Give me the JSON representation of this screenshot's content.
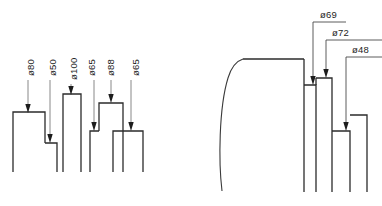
{
  "drawing": {
    "title": "Stepped shaft profile dimension drawing",
    "background_color": "#ffffff",
    "line_color": "#2b2b2b",
    "leader_color": "#6a6a6a",
    "text_color": "#1d1d1d",
    "width": 382,
    "height": 206
  },
  "left_view": {
    "name": "left-stepped-profile",
    "dimensions": [
      {
        "id": "d-80",
        "label": "ø80",
        "value": 80,
        "unit": "mm",
        "symbol": "diameter",
        "orientation": "vertical",
        "text_x": 31,
        "text_y": 76,
        "leader_x": 28,
        "leader_top": 80,
        "leader_bottom": 112
      },
      {
        "id": "d-50",
        "label": "ø50",
        "value": 50,
        "unit": "mm",
        "symbol": "diameter",
        "orientation": "vertical",
        "text_x": 53,
        "text_y": 76,
        "leader_x": 50,
        "leader_top": 80,
        "leader_bottom": 140
      },
      {
        "id": "d-100",
        "label": "ø100",
        "value": 100,
        "unit": "mm",
        "symbol": "diameter",
        "orientation": "vertical",
        "text_x": 74,
        "text_y": 80,
        "leader_x": 71,
        "leader_top": 84,
        "leader_bottom": 94
      },
      {
        "id": "d-65a",
        "label": "ø65",
        "value": 65,
        "unit": "mm",
        "symbol": "diameter",
        "orientation": "vertical",
        "text_x": 92,
        "text_y": 76,
        "leader_x": 89,
        "leader_top": 80,
        "leader_bottom": 130
      },
      {
        "id": "d-88",
        "label": "ø88",
        "value": 88,
        "unit": "mm",
        "symbol": "diameter",
        "orientation": "vertical",
        "text_x": 111,
        "text_y": 76,
        "leader_x": 108,
        "leader_top": 80,
        "leader_bottom": 103
      },
      {
        "id": "d-65b",
        "label": "ø65",
        "value": 65,
        "unit": "mm",
        "symbol": "diameter",
        "orientation": "vertical",
        "text_x": 136,
        "text_y": 76,
        "leader_x": 131,
        "leader_top": 80,
        "leader_bottom": 131
      }
    ],
    "profile_path": "M 13,172 L 13,112 L 45,112 L 45,143 L 57,143 L 57,172 M 63,172 L 63,94 L 81,94 L 81,172 M 90,172 L 90,131 L 99,131 L 99,172 M 99,131 L 99,103 L 123,103 L 123,172 M 113,172 L 113,131 L 143,131 L 143,172",
    "steps": [
      {
        "name": "step-1",
        "x_left": 13,
        "x_right": 45,
        "top_y": 112,
        "bottom_y": 172,
        "diameter": 80
      },
      {
        "name": "step-2",
        "x_left": 45,
        "x_right": 57,
        "top_y": 143,
        "bottom_y": 172,
        "diameter": 50
      },
      {
        "name": "step-3",
        "x_left": 63,
        "x_right": 81,
        "top_y": 94,
        "bottom_y": 172,
        "diameter": 100
      },
      {
        "name": "step-4",
        "x_left": 90,
        "x_right": 99,
        "top_y": 131,
        "bottom_y": 172,
        "diameter": 65
      },
      {
        "name": "step-5",
        "x_left": 99,
        "x_right": 123,
        "top_y": 103,
        "bottom_y": 172,
        "diameter": 88
      },
      {
        "name": "step-6",
        "x_left": 113,
        "x_right": 143,
        "top_y": 131,
        "bottom_y": 172,
        "diameter": 65
      }
    ]
  },
  "right_view": {
    "name": "right-stepped-profile",
    "dimensions": [
      {
        "id": "d-69",
        "label": "ø69",
        "value": 69,
        "unit": "mm",
        "symbol": "diameter",
        "orientation": "horizontal",
        "text_x": 322,
        "text_y": 17,
        "leader_points": "313,21 313,28 313,28 313,28",
        "elbow_x": 313,
        "elbow_y": 24,
        "drop_x": 313,
        "drop_to_y": 83
      },
      {
        "id": "d-72",
        "label": "ø72",
        "value": 72,
        "unit": "mm",
        "symbol": "diameter",
        "orientation": "horizontal",
        "text_x": 334,
        "text_y": 35,
        "elbow_x": 326,
        "elbow_y": 42,
        "drop_x": 326,
        "drop_to_y": 75
      },
      {
        "id": "d-48",
        "label": "ø48",
        "value": 48,
        "unit": "mm",
        "symbol": "diameter",
        "orientation": "horizontal",
        "text_x": 356,
        "text_y": 52,
        "elbow_x": 346,
        "elbow_y": 59,
        "drop_x": 346,
        "drop_to_y": 128
      }
    ],
    "curved_edge_path": "M 222,190 C 219,160 219,110 228,78 C 231,68 236,62 243,59",
    "top_edge_path": "M 243,59 L 303,59",
    "profile_path": "M 303,59 L 303,192 M 303,85 L 315,85 M 315,85 L 315,192 M 315,78 L 331,78 M 331,78 L 331,192 M 331,131 L 349,131 M 349,131 L 349,192 M 349,115 L 366,115 M 366,115 L 366,192",
    "steps": [
      {
        "name": "step-a",
        "x_left": 303,
        "x_right": 315,
        "top_y": 85,
        "bottom_y": 192,
        "diameter": 69
      },
      {
        "name": "step-b",
        "x_left": 315,
        "x_right": 331,
        "top_y": 78,
        "bottom_y": 192,
        "diameter": 72
      },
      {
        "name": "step-c",
        "x_left": 331,
        "x_right": 349,
        "top_y": 131,
        "bottom_y": 192,
        "diameter": 48
      },
      {
        "name": "step-d",
        "x_left": 349,
        "x_right": 366,
        "top_y": 115,
        "bottom_y": 192,
        "diameter": null
      }
    ]
  }
}
